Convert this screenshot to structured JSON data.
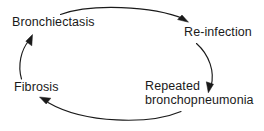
{
  "diagram": {
    "type": "cycle-diagram",
    "direction": "clockwise",
    "stroke_color": "#1a1a1a",
    "text_color": "#1a1a1a",
    "background_color": "#ffffff",
    "nodes": [
      {
        "id": "bronchiectasis",
        "label": "Bronchiectasis",
        "position": "top-left"
      },
      {
        "id": "reinfection",
        "label": "Re-infection",
        "position": "top-right"
      },
      {
        "id": "repeated-bronchopneumonia",
        "label_line1": "Repeated",
        "label_line2": "bronchopneumonia",
        "position": "bottom-right"
      },
      {
        "id": "fibrosis",
        "label": "Fibrosis",
        "position": "bottom-left"
      }
    ],
    "arrows": [
      {
        "id": "arrow-bronchiectasis-to-reinfection",
        "from": "bronchiectasis",
        "to": "reinfection",
        "shape": "arc-top"
      },
      {
        "id": "arrow-reinfection-to-bronchopneumonia",
        "from": "reinfection",
        "to": "repeated-bronchopneumonia",
        "shape": "arc-right"
      },
      {
        "id": "arrow-bronchopneumonia-to-fibrosis",
        "from": "repeated-bronchopneumonia",
        "to": "fibrosis",
        "shape": "arc-bottom"
      },
      {
        "id": "arrow-fibrosis-to-bronchiectasis",
        "from": "fibrosis",
        "to": "bronchiectasis",
        "shape": "arc-left"
      }
    ]
  }
}
